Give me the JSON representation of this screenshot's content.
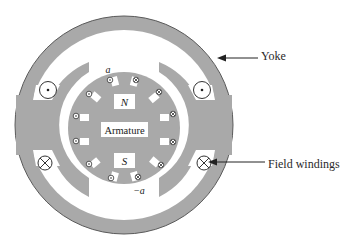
{
  "diagram": {
    "labels": {
      "armature": "Armature",
      "north_pole": "N",
      "south_pole": "S",
      "coil_a": "a",
      "coil_minus_a": "−a",
      "yoke": "Yoke",
      "field_windings": "Field windings"
    },
    "symbols": {
      "dot": "current out of page (dot)",
      "cross": "current into page (cross)"
    },
    "colors": {
      "iron": "#a9a9a9",
      "outline": "#555555",
      "background": "#ffffff",
      "text": "#2a2a2a"
    }
  }
}
